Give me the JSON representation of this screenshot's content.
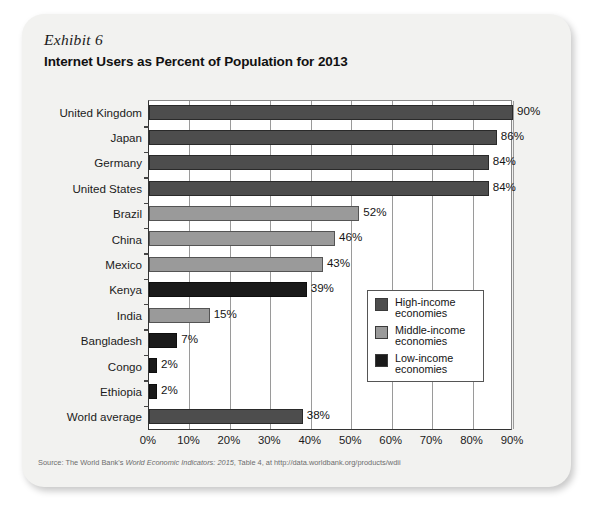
{
  "card": {
    "exhibit_label": "Exhibit 6",
    "title": "Internet Users as Percent of Population for 2013",
    "source_prefix": "Source: The World Bank's ",
    "source_italic": "World Economic Indicators: 2015",
    "source_suffix": ", Table 4, at http://data.worldbank.org/products/wdii"
  },
  "legend": {
    "items": [
      {
        "label_line1": "High-income",
        "label_line2": "economies",
        "color": "#4d4d4d",
        "key": "high-income"
      },
      {
        "label_line1": "Middle-income",
        "label_line2": "economies",
        "color": "#9a9a9a",
        "key": "middle-income"
      },
      {
        "label_line1": "Low-income",
        "label_line2": "economies",
        "color": "#1a1a1a",
        "key": "low-income"
      }
    ]
  },
  "chart_data": {
    "type": "bar",
    "orientation": "horizontal",
    "title": "Internet Users as Percent of Population for 2013",
    "xlabel": "",
    "ylabel": "",
    "xlim": [
      0,
      90
    ],
    "grid": true,
    "legend_position": "inside-right",
    "xticks": [
      0,
      10,
      20,
      30,
      40,
      50,
      60,
      70,
      80,
      90
    ],
    "xtick_labels": [
      "0%",
      "10%",
      "20%",
      "30%",
      "40%",
      "50%",
      "60%",
      "70%",
      "80%",
      "90%"
    ],
    "categories": [
      "United Kingdom",
      "Japan",
      "Germany",
      "United States",
      "Brazil",
      "China",
      "Mexico",
      "Kenya",
      "India",
      "Bangladesh",
      "Congo",
      "Ethiopia",
      "World average"
    ],
    "values": [
      90,
      86,
      84,
      84,
      52,
      46,
      43,
      39,
      15,
      7,
      2,
      2,
      38
    ],
    "value_labels": [
      "90%",
      "86%",
      "84%",
      "84%",
      "52%",
      "46%",
      "43%",
      "39%",
      "15%",
      "7%",
      "2%",
      "2%",
      "38%"
    ],
    "groups": [
      "high-income",
      "high-income",
      "high-income",
      "high-income",
      "middle-income",
      "middle-income",
      "middle-income",
      "low-income",
      "middle-income",
      "low-income",
      "low-income",
      "low-income",
      "high-income"
    ],
    "group_colors": {
      "high-income": "#4d4d4d",
      "middle-income": "#9a9a9a",
      "low-income": "#1a1a1a"
    },
    "series": [
      {
        "name": "Internet users as percent of population, 2013",
        "values": [
          90,
          86,
          84,
          84,
          52,
          46,
          43,
          39,
          15,
          7,
          2,
          2,
          38
        ]
      }
    ]
  }
}
